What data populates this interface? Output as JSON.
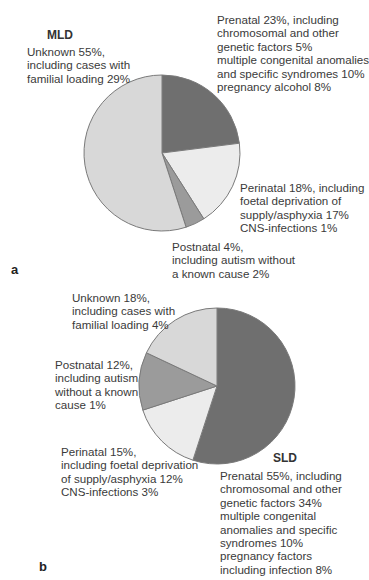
{
  "chart_data": [
    {
      "type": "pie",
      "panel": "a",
      "title": "MLD",
      "start_angle_deg": 0,
      "direction": "clockwise",
      "categories": [
        "Prenatal",
        "Perinatal",
        "Postnatal",
        "Unknown"
      ],
      "values": [
        23,
        18,
        4,
        55
      ],
      "colors": [
        "#6f6f6f",
        "#ececec",
        "#9b9b9b",
        "#d8d8d8"
      ],
      "labels": [
        "Prenatal 23%, including\nchromosomal and other\ngenetic factors 5%\nmultiple congenital anomalies\nand specific syndromes 10%\npregnancy alcohol 8%",
        "Perinatal 18%, including\nfoetal deprivation of\nsupply/asphyxia 17%\nCNS-infections 1%",
        "Postnatal 4%,\nincluding autism without\na known cause 2%",
        "Unknown 55%,\nincluding cases with\nfamilial loading 29%"
      ],
      "sub_values": {
        "Prenatal": {
          "chromosomal and other genetic factors": 5,
          "multiple congenital anomalies and specific syndromes": 10,
          "pregnancy alcohol": 8
        },
        "Perinatal": {
          "foetal deprivation of supply/asphyxia": 17,
          "CNS-infections": 1
        },
        "Postnatal": {
          "autism without a known cause": 2
        },
        "Unknown": {
          "cases with familial loading": 29
        }
      }
    },
    {
      "type": "pie",
      "panel": "b",
      "title": "SLD",
      "start_angle_deg": 0,
      "direction": "clockwise",
      "categories": [
        "Prenatal",
        "Perinatal",
        "Postnatal",
        "Unknown"
      ],
      "values": [
        55,
        15,
        12,
        18
      ],
      "colors": [
        "#6f6f6f",
        "#ececec",
        "#9b9b9b",
        "#d8d8d8"
      ],
      "labels": [
        "Prenatal 55%, including\nchromosomal and other\ngenetic factors 34%\nmultiple congenital\nanomalies and specific\nsyndromes 10%\npregnancy factors\nincluding infection 8%",
        "Perinatal 15%,\nincluding foetal deprivation\nof supply/asphyxia 12%\nCNS-infections 3%",
        "Postnatal 12%,\nincluding autism\nwithout a known\ncause 1%",
        "Unknown 18%,\nincluding cases with\nfamilial loading 4%"
      ],
      "sub_values": {
        "Prenatal": {
          "chromosomal and other genetic factors": 34,
          "multiple congenital anomalies and specific syndromes": 10,
          "pregnancy factors including infection": 8
        },
        "Perinatal": {
          "foetal deprivation of supply/asphyxia": 12,
          "CNS-infections": 3
        },
        "Postnatal": {
          "autism without a known cause": 1
        },
        "Unknown": {
          "cases with familial loading": 4
        }
      }
    }
  ],
  "figure": {
    "a": {
      "panel_letter": "a",
      "title": "MLD",
      "prenatal": "Prenatal 23%, including\nchromosomal and other\ngenetic factors 5%\nmultiple congenital anomalies\nand specific syndromes 10%\npregnancy alcohol 8%",
      "perinatal": "Perinatal 18%, including\nfoetal deprivation of\nsupply/asphyxia 17%\nCNS-infections 1%",
      "postnatal": "Postnatal 4%,\nincluding autism without\na known cause 2%",
      "unknown": "Unknown 55%,\nincluding cases with\nfamilial loading 29%"
    },
    "b": {
      "panel_letter": "b",
      "title": "SLD",
      "prenatal": "Prenatal 55%, including\nchromosomal and other\ngenetic factors 34%\nmultiple congenital\nanomalies and specific\nsyndromes 10%\npregnancy factors\nincluding infection 8%",
      "perinatal": "Perinatal 15%,\nincluding foetal deprivation\nof supply/asphyxia 12%\nCNS-infections 3%",
      "postnatal": "Postnatal 12%,\nincluding autism\nwithout a known\ncause 1%",
      "unknown": "Unknown 18%,\nincluding cases with\nfamilial loading 4%"
    }
  }
}
